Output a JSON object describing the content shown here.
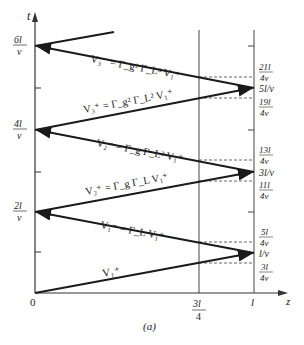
{
  "figure": {
    "caption": "(a)",
    "axes": {
      "x_label": "z",
      "y_label": "t",
      "origin_label": "0",
      "x_ticks": [
        {
          "num": "3l",
          "den": "4"
        },
        {
          "single": "l"
        }
      ]
    },
    "left_time_labels": [
      {
        "num": "2l",
        "den": "v"
      },
      {
        "num": "4l",
        "den": "v"
      },
      {
        "num": "6l",
        "den": "v"
      }
    ],
    "right_time_labels": {
      "crossings": [
        {
          "num": "3l",
          "den": "4v"
        },
        {
          "num": "5l",
          "den": "4v"
        },
        {
          "num": "11l",
          "den": "4v"
        },
        {
          "num": "13l",
          "den": "4v"
        },
        {
          "num": "19l",
          "den": "4v"
        },
        {
          "num": "21l",
          "den": "4v"
        }
      ],
      "arrivals": [
        "l/v",
        "3l/v",
        "5l/v"
      ]
    },
    "waves": [
      {
        "name": "V1+",
        "label": "V",
        "sup": "+",
        "sub": "1"
      },
      {
        "name": "V1-",
        "label": "V",
        "sup": "−",
        "sub": "1",
        "eq": "= Γ",
        "eq_sub": "L",
        "tail": " V",
        "tail_sup": "+",
        "tail_sub": "1"
      },
      {
        "name": "V2+",
        "label": "V",
        "sup": "+",
        "sub": "2"
      },
      {
        "name": "V2-",
        "label": "V",
        "sup": "−",
        "sub": "2"
      },
      {
        "name": "V3+",
        "label": "V",
        "sup": "+",
        "sub": "3"
      },
      {
        "name": "V3-",
        "label": "V",
        "sup": "−",
        "sub": "3"
      }
    ],
    "wave_equations": {
      "v1p": "V₁⁺",
      "v1m": "V₁⁻ = Γ_L V₁⁺",
      "v2p": "V₂⁺ = Γ_g Γ_L V₁⁺",
      "v2m": "V₂⁻ = Γ_g Γ_L² V₁⁺",
      "v3p": "V₃⁺ = Γ_g² Γ_L² V₁⁺",
      "v3m": "V₃⁻ = Γ_g² Γ_L³ V₁⁺"
    },
    "colors": {
      "line": "#1a1a1a",
      "axis": "#333333",
      "dashed": "#555555"
    }
  }
}
